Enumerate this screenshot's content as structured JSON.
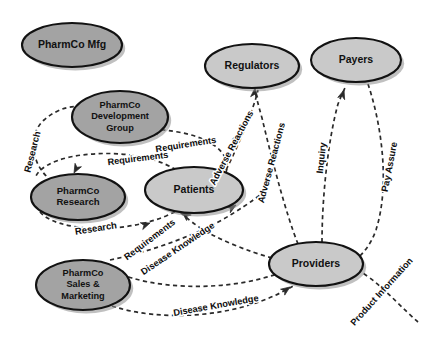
{
  "diagram": {
    "background_color": "#ffffff",
    "node_fill_dark": "#a3a3a3",
    "node_fill_light": "#c9c9c9",
    "node_stroke": "#121212",
    "edge_color": "#2a2a2a",
    "label_color": "#0d0d0d",
    "nodes": [
      {
        "id": "pharmco-mfg",
        "lines": [
          "PharmCo Mfg"
        ],
        "cx": 72,
        "cy": 45,
        "rx": 50,
        "ry": 22,
        "fill": "#a3a3a3",
        "font_size": 10.5
      },
      {
        "id": "pharmco-development-group",
        "lines": [
          "PharmCo",
          "Development",
          "Group"
        ],
        "cx": 120,
        "cy": 117,
        "rx": 48,
        "ry": 26,
        "fill": "#a3a3a3",
        "font_size": 9.2
      },
      {
        "id": "pharmco-research",
        "lines": [
          "PharmCo",
          "Research"
        ],
        "cx": 78,
        "cy": 197,
        "rx": 47,
        "ry": 23,
        "fill": "#a3a3a3",
        "font_size": 9.6
      },
      {
        "id": "patients",
        "lines": [
          "Patients"
        ],
        "cx": 194,
        "cy": 190,
        "rx": 49,
        "ry": 23,
        "fill": "#c9c9c9",
        "font_size": 10.5
      },
      {
        "id": "pharmco-sales-marketing",
        "lines": [
          "PharmCo",
          "Sales &",
          "Marketing"
        ],
        "cx": 83,
        "cy": 285,
        "rx": 47,
        "ry": 25,
        "fill": "#a3a3a3",
        "font_size": 9.2
      },
      {
        "id": "regulators",
        "lines": [
          "Regulators"
        ],
        "cx": 252,
        "cy": 66,
        "rx": 47,
        "ry": 22,
        "fill": "#c9c9c9",
        "font_size": 10.5
      },
      {
        "id": "payers",
        "lines": [
          "Payers"
        ],
        "cx": 356,
        "cy": 60,
        "rx": 45,
        "ry": 22,
        "fill": "#c9c9c9",
        "font_size": 10.5
      },
      {
        "id": "providers",
        "lines": [
          "Providers"
        ],
        "cx": 316,
        "cy": 264,
        "rx": 47,
        "ry": 22,
        "fill": "#c9c9c9",
        "font_size": 10.5
      }
    ],
    "edges": [
      {
        "id": "research-up",
        "label": "Research",
        "from": "pharmco-research",
        "to": "pharmco-development-group",
        "path": "M 52 181 C 30 165 28 134 44 120 C 58 108 72 105 84 107",
        "arrow": {
          "x": 88,
          "y": 108,
          "angle": 15
        },
        "label_x": 33,
        "label_y": 152,
        "label_rotate": -76,
        "font_size": 9.4
      },
      {
        "id": "requirements-upper",
        "label": "Requirements",
        "from": "patients",
        "to": "pharmco-development-group",
        "path": "M 226 173 C 232 150 206 137 178 132 C 166 130 158 129 152 130",
        "arrow": {
          "x": 149,
          "y": 130,
          "angle": 188
        },
        "label_x": 186,
        "label_y": 145,
        "label_rotate": -9,
        "font_size": 9.2
      },
      {
        "id": "requirements-lower",
        "label": "Requirements",
        "from": "patients",
        "to": "pharmco-research",
        "path": "M 176 170 C 150 153 104 150 70 157 C 52 161 40 168 36 176",
        "arrow": {
          "x": 74,
          "y": 173,
          "angle": 118
        },
        "label_x": 138,
        "label_y": 159,
        "label_rotate": -7,
        "font_size": 9.2
      },
      {
        "id": "research-to-patients",
        "label": "Research",
        "from": "pharmco-research",
        "to": "patients",
        "path": "M 40 212 C 56 231 120 235 166 216 C 180 210 188 204 192 199",
        "arrow": {
          "x": 150,
          "y": 223,
          "angle": -20
        },
        "label_x": 96,
        "label_y": 229,
        "label_rotate": -9,
        "font_size": 9.4
      },
      {
        "id": "requirements-diagonal",
        "label": "Requirements",
        "from": "providers",
        "to": "patients",
        "path": "M 272 258 C 250 252 212 238 192 222 C 184 216 180 212 178 209",
        "arrow": {
          "x": 182,
          "y": 212,
          "angle": -140
        },
        "label_x": 150,
        "label_y": 240,
        "label_rotate": -37,
        "font_size": 9.2
      },
      {
        "id": "disease-knowledge-diagonal",
        "label": "Disease Knowledge",
        "from": "patients",
        "to": "providers",
        "path": "M 110 260 C 150 252 200 234 232 214 C 250 203 262 194 268 188",
        "arrow": {
          "x": 236,
          "y": 205,
          "angle": -32
        },
        "label_x": 178,
        "label_y": 249,
        "label_rotate": -34,
        "font_size": 9.2
      },
      {
        "id": "disease-knowledge-bottom",
        "label": "Disease Knowledge",
        "from": "pharmco-sales-marketing",
        "to": "providers",
        "path": "M 112 306 C 160 322 232 318 282 292 C 298 284 308 277 312 272",
        "arrow": {
          "x": 290,
          "y": 287,
          "angle": -35
        },
        "label_x": 216,
        "label_y": 306,
        "label_rotate": -10,
        "font_size": 9.2
      },
      {
        "id": "sales-inbound",
        "label": "",
        "from": "providers",
        "to": "pharmco-sales-marketing",
        "path": "M 282 272 C 236 290 172 290 132 278 C 120 274 114 271 110 268",
        "arrow": {
          "x": 114,
          "y": 270,
          "angle": -150
        },
        "label_x": 0,
        "label_y": 0,
        "label_rotate": 0,
        "font_size": 9.2
      },
      {
        "id": "adverse-reactions-regulators",
        "label": "Adverse Reactions",
        "from": "providers",
        "to": "regulators",
        "path": "M 298 244 C 286 214 272 160 262 118 C 258 104 256 96 255 90",
        "arrow": {
          "x": 255,
          "y": 88,
          "angle": -85
        },
        "label_x": 272,
        "label_y": 163,
        "label_rotate": -75,
        "font_size": 9.2
      },
      {
        "id": "adverse-reactions-patients",
        "label": "Adverse Reactions",
        "from": "patients",
        "to": "regulators",
        "path": "M 226 170 C 238 146 248 122 254 104 C 256 98 257 94 258 90",
        "arrow": {
          "x": 239,
          "y": 132,
          "angle": -70
        },
        "label_x": 232,
        "label_y": 148,
        "label_rotate": -62,
        "font_size": 9.2
      },
      {
        "id": "inquiry",
        "label": "Inquiry",
        "from": "providers",
        "to": "payers",
        "path": "M 322 242 C 322 198 328 140 338 104 C 342 94 344 90 346 86",
        "arrow": {
          "x": 344,
          "y": 90,
          "angle": -72
        },
        "label_x": 322,
        "label_y": 158,
        "label_rotate": -84,
        "font_size": 9.4
      },
      {
        "id": "pay-assure",
        "label": "Pay Assure",
        "from": "payers",
        "to": "providers",
        "path": "M 368 84 C 382 126 390 186 376 230 C 366 258 346 268 334 270",
        "arrow": {
          "x": 338,
          "y": 270,
          "angle": 172
        },
        "label_x": 390,
        "label_y": 167,
        "label_rotate": -79,
        "font_size": 9.4
      },
      {
        "id": "product-information",
        "label": "Product Information",
        "from": "pharmco-sales-marketing",
        "to": "providers",
        "path": "M 418 322 C 404 310 388 292 370 278 C 356 268 348 264 344 262",
        "arrow": {
          "x": 348,
          "y": 264,
          "angle": 198
        },
        "label_x": 382,
        "label_y": 292,
        "label_rotate": -48,
        "font_size": 9.2
      }
    ]
  }
}
